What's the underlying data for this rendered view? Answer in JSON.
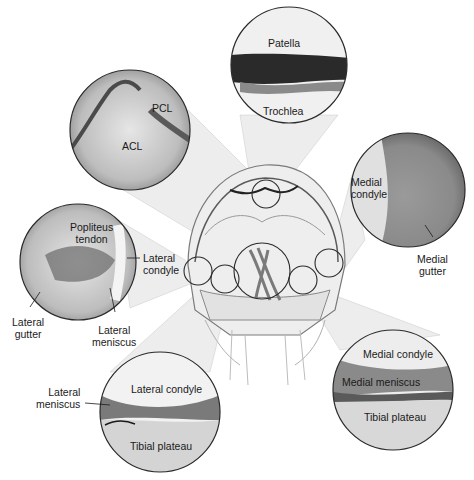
{
  "figure": {
    "views": [
      {
        "id": "patellofemoral",
        "labels": [
          "Patella",
          "Trochlea"
        ]
      },
      {
        "id": "intercondylar-notch",
        "labels": [
          "PCL",
          "ACL"
        ]
      },
      {
        "id": "medial-gutter",
        "labels": [
          "Medial condyle",
          "Medial gutter"
        ]
      },
      {
        "id": "lateral-gutter",
        "labels": [
          "Popliteus tendon",
          "Lateral condyle",
          "Lateral gutter",
          "Lateral meniscus"
        ]
      },
      {
        "id": "lateral-compartment",
        "labels": [
          "Lateral meniscus",
          "Lateral condyle",
          "Tibial plateau"
        ]
      },
      {
        "id": "medial-compartment",
        "labels": [
          "Medial condyle",
          "Medial meniscus",
          "Tibial plateau"
        ]
      }
    ]
  },
  "labels": {
    "patella": "Patella",
    "trochlea": "Trochlea",
    "pcl": "PCL",
    "acl": "ACL",
    "medial_condyle_top_1": "Medial",
    "medial_condyle_top_2": "condyle",
    "medial_gutter_1": "Medial",
    "medial_gutter_2": "gutter",
    "popliteus_1": "Popliteus",
    "popliteus_2": "tendon",
    "lateral_condyle_mid_1": "Lateral",
    "lateral_condyle_mid_2": "condyle",
    "lateral_gutter_1": "Lateral",
    "lateral_gutter_2": "gutter",
    "lateral_meniscus_mid_1": "Lateral",
    "lateral_meniscus_mid_2": "meniscus",
    "lateral_meniscus_bot_1": "Lateral",
    "lateral_meniscus_bot_2": "meniscus",
    "lateral_condyle_bot": "Lateral condyle",
    "tibial_plateau_left": "Tibial plateau",
    "medial_condyle_bot": "Medial condyle",
    "medial_meniscus_bot": "Medial meniscus",
    "tibial_plateau_right": "Tibial plateau"
  },
  "colors": {
    "background": "#ffffff",
    "outline": "#2a2a2a",
    "text": "#1a1a1a"
  }
}
